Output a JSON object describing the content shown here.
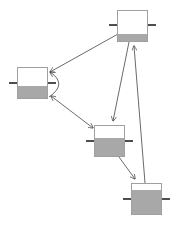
{
  "diagram": {
    "colors": {
      "background": "#ffffff",
      "tank_border": "#a0a0a0",
      "tank_fill": "#a8a8a8",
      "stub": "#222222",
      "edge": "#444444"
    },
    "tanks": [
      {
        "id": "A",
        "x": 117,
        "y": 10,
        "w": 31,
        "h": 32,
        "fill_top": 34,
        "stub_y": 25
      },
      {
        "id": "B",
        "x": 17,
        "y": 67,
        "w": 31,
        "h": 32,
        "fill_top": 86,
        "stub_y": 83
      },
      {
        "id": "C",
        "x": 94,
        "y": 125,
        "w": 31,
        "h": 32,
        "fill_top": 138,
        "stub_y": 141
      },
      {
        "id": "D",
        "x": 131,
        "y": 183,
        "w": 31,
        "h": 32,
        "fill_top": 190,
        "stub_y": 199
      }
    ],
    "edges": [
      {
        "from": "A",
        "to": "B",
        "x1": 118,
        "y1": 34,
        "x2": 50,
        "y2": 72,
        "heads": [
          "end"
        ]
      },
      {
        "from": "A",
        "to": "C",
        "x1": 129,
        "y1": 42,
        "x2": 113,
        "y2": 121,
        "heads": [
          "end"
        ]
      },
      {
        "from": "D",
        "to": "A",
        "x1": 145,
        "y1": 183,
        "x2": 134,
        "y2": 46,
        "heads": [
          "end"
        ]
      },
      {
        "from": "B",
        "to": "C",
        "x1": 51,
        "y1": 96,
        "x2": 93,
        "y2": 128,
        "heads": [
          "start",
          "end"
        ]
      },
      {
        "from": "C",
        "to": "D",
        "x1": 119,
        "y1": 157,
        "x2": 135,
        "y2": 179,
        "heads": [
          "end"
        ]
      },
      {
        "from": "B",
        "to": "B",
        "curve": "M 49 97 Q 68 84 50 72",
        "heads": [
          "end"
        ]
      }
    ]
  }
}
